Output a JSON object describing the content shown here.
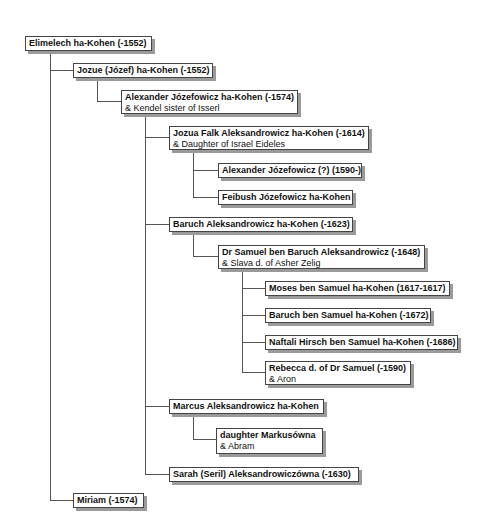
{
  "nodes": [
    {
      "id": "elimelech",
      "name": "Elimelech ha-Kohen (-1552)",
      "spouse": "",
      "x": 25,
      "y": 36,
      "w": 127,
      "h": 15
    },
    {
      "id": "jozue",
      "name": "Jozue (Józef) ha-Kohen (-1552)",
      "spouse": "",
      "x": 73,
      "y": 63,
      "w": 140,
      "h": 15
    },
    {
      "id": "alexander",
      "name": "Alexander Józefowicz ha-Kohen (-1574)",
      "spouse": "& Kendel sister of Isserl",
      "x": 121,
      "y": 90,
      "w": 177,
      "h": 24
    },
    {
      "id": "jozua-falk",
      "name": "Jozua Falk Aleksandrowicz ha-Kohen (-1614)",
      "spouse": "& Daughter of Israel Eideles",
      "x": 169,
      "y": 126,
      "w": 200,
      "h": 24
    },
    {
      "id": "alexander-jozefowicz-2",
      "name": "Alexander Józefowicz (?) (1590-)",
      "spouse": "",
      "x": 218,
      "y": 163,
      "w": 144,
      "h": 15
    },
    {
      "id": "feibush",
      "name": "Feibush Józefowicz ha-Kohen",
      "spouse": "",
      "x": 218,
      "y": 190,
      "w": 135,
      "h": 15
    },
    {
      "id": "baruch-aleksandrowicz",
      "name": "Baruch Aleksandrowicz ha-Kohen (-1623)",
      "spouse": "",
      "x": 169,
      "y": 217,
      "w": 184,
      "h": 15
    },
    {
      "id": "dr-samuel",
      "name": "Dr Samuel ben Baruch Aleksandrowicz (-1648)",
      "spouse": "& Slava d. of Asher Zelig",
      "x": 218,
      "y": 245,
      "w": 207,
      "h": 24
    },
    {
      "id": "moses",
      "name": "Moses ben Samuel ha-Kohen (1617-1617)",
      "spouse": "",
      "x": 265,
      "y": 281,
      "w": 185,
      "h": 15
    },
    {
      "id": "baruch-ben-samuel",
      "name": "Baruch ben Samuel ha-Kohen (-1672)",
      "spouse": "",
      "x": 265,
      "y": 308,
      "w": 166,
      "h": 15
    },
    {
      "id": "naftali",
      "name": "Naftali Hirsch ben Samuel ha-Kohen (-1686)",
      "spouse": "",
      "x": 265,
      "y": 335,
      "w": 193,
      "h": 15
    },
    {
      "id": "rebecca",
      "name": "Rebecca d. of Dr Samuel (-1590)",
      "spouse": "& Aron",
      "x": 265,
      "y": 361,
      "w": 146,
      "h": 24
    },
    {
      "id": "marcus",
      "name": "Marcus Aleksandrowicz ha-Kohen",
      "spouse": "",
      "x": 169,
      "y": 399,
      "w": 155,
      "h": 15
    },
    {
      "id": "daughter-markusowna",
      "name": "daughter Markusówna",
      "spouse": "& Abram",
      "x": 216,
      "y": 428,
      "w": 107,
      "h": 26
    },
    {
      "id": "sarah",
      "name": "Sarah (Seril) Aleksandrowiczówna (-1630)",
      "spouse": "",
      "x": 169,
      "y": 467,
      "w": 190,
      "h": 15
    },
    {
      "id": "miriam",
      "name": "Miriam (-1574)",
      "spouse": "",
      "x": 73,
      "y": 493,
      "w": 71,
      "h": 15
    }
  ],
  "lines": [
    {
      "x": 50,
      "y": 51,
      "w": 1,
      "h": 450
    },
    {
      "x": 50,
      "y": 70,
      "w": 23,
      "h": 1
    },
    {
      "x": 50,
      "y": 500,
      "w": 23,
      "h": 1
    },
    {
      "x": 97,
      "y": 78,
      "w": 1,
      "h": 24
    },
    {
      "x": 97,
      "y": 101,
      "w": 24,
      "h": 1
    },
    {
      "x": 145,
      "y": 114,
      "w": 1,
      "h": 361
    },
    {
      "x": 145,
      "y": 137,
      "w": 24,
      "h": 1
    },
    {
      "x": 145,
      "y": 224,
      "w": 24,
      "h": 1
    },
    {
      "x": 145,
      "y": 406,
      "w": 24,
      "h": 1
    },
    {
      "x": 145,
      "y": 474,
      "w": 24,
      "h": 1
    },
    {
      "x": 193,
      "y": 150,
      "w": 1,
      "h": 48
    },
    {
      "x": 193,
      "y": 170,
      "w": 25,
      "h": 1
    },
    {
      "x": 193,
      "y": 197,
      "w": 25,
      "h": 1
    },
    {
      "x": 193,
      "y": 232,
      "w": 1,
      "h": 25
    },
    {
      "x": 193,
      "y": 256,
      "w": 25,
      "h": 1
    },
    {
      "x": 242,
      "y": 269,
      "w": 1,
      "h": 104
    },
    {
      "x": 242,
      "y": 288,
      "w": 23,
      "h": 1
    },
    {
      "x": 242,
      "y": 315,
      "w": 23,
      "h": 1
    },
    {
      "x": 242,
      "y": 342,
      "w": 23,
      "h": 1
    },
    {
      "x": 242,
      "y": 372,
      "w": 23,
      "h": 1
    },
    {
      "x": 193,
      "y": 414,
      "w": 1,
      "h": 26
    },
    {
      "x": 193,
      "y": 439,
      "w": 23,
      "h": 1
    }
  ]
}
